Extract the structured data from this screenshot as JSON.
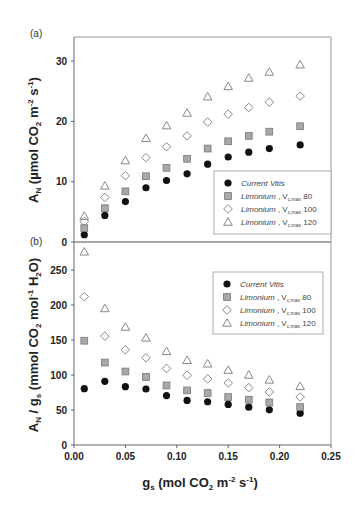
{
  "chart_data": [
    {
      "type": "scatter",
      "panel_label": "(a)",
      "title": "",
      "xlabel": "",
      "ylabel": "A_N (µmol CO2 m-2 s-1)",
      "ylabel_parts": {
        "main": "A",
        "sub": "N",
        "rest1": " (µmol CO",
        "sub2": "2",
        "rest2": " m",
        "sup1": "-2",
        "rest3": " s",
        "sup2": "-1",
        "rest4": ")"
      },
      "xlim": [
        0,
        0.25
      ],
      "ylim": [
        0,
        34
      ],
      "yticks": [
        0,
        10,
        20,
        30
      ],
      "ytick_labels": [
        "0",
        "10",
        "20",
        "30"
      ],
      "grid": false,
      "legend_position": "bottom-right",
      "x": [
        0.01,
        0.03,
        0.05,
        0.07,
        0.09,
        0.11,
        0.13,
        0.15,
        0.17,
        0.19,
        0.22
      ],
      "series": [
        {
          "name": "Current Vitis",
          "marker": "filled-circle",
          "values": [
            1.2,
            4.4,
            6.7,
            9.0,
            10.2,
            11.3,
            12.9,
            14.1,
            14.9,
            15.5,
            16.1
          ]
        },
        {
          "name": "Limonium , Vc,max 80",
          "marker": "gray-square",
          "values": [
            2.3,
            5.6,
            8.4,
            10.9,
            12.3,
            13.8,
            15.5,
            16.7,
            17.6,
            18.3,
            19.2
          ]
        },
        {
          "name": "Limonium , Vc,max 100",
          "marker": "open-diamond",
          "values": [
            3.4,
            7.4,
            11.0,
            14.0,
            15.8,
            17.6,
            19.9,
            21.2,
            22.3,
            23.2,
            24.2
          ]
        },
        {
          "name": "Limonium , Vc,max 120",
          "marker": "open-triangle",
          "values": [
            4.3,
            9.3,
            13.5,
            17.2,
            19.3,
            21.4,
            24.1,
            25.8,
            27.2,
            28.2,
            29.4
          ]
        }
      ]
    },
    {
      "type": "scatter",
      "panel_label": "(b)",
      "title": "",
      "xlabel": "g_s (mol CO2 m-2 s-1)",
      "ylabel": "A_N / g_s (mmol CO2 mol-1 H2O)",
      "xlim": [
        0,
        0.25
      ],
      "ylim": [
        0,
        290
      ],
      "xticks": [
        0,
        0.05,
        0.1,
        0.15,
        0.2,
        0.25
      ],
      "xtick_labels": [
        "0.00",
        "0.05",
        "0.10",
        "0.15",
        "0.20",
        "0.25"
      ],
      "yticks": [
        0,
        50,
        100,
        150,
        200,
        250
      ],
      "ytick_labels": [
        "0",
        "50",
        "100",
        "150",
        "200",
        "250"
      ],
      "grid": false,
      "legend_position": "top-right",
      "x": [
        0.01,
        0.03,
        0.05,
        0.07,
        0.09,
        0.11,
        0.13,
        0.15,
        0.17,
        0.19,
        0.22
      ],
      "series": [
        {
          "name": "Current Vitis",
          "marker": "filled-circle",
          "values": [
            80.5,
            91,
            83.3,
            80,
            70.6,
            63.7,
            61.8,
            58,
            54.1,
            50.3,
            45.5
          ]
        },
        {
          "name": "Limonium , Vc,max 80",
          "marker": "gray-square",
          "values": [
            149,
            117.8,
            105,
            97.2,
            85.1,
            78,
            74.2,
            68.5,
            64.7,
            60.8,
            54.2
          ]
        },
        {
          "name": "Limonium , Vc,max 100",
          "marker": "open-diamond",
          "values": [
            212,
            155.6,
            136,
            124.6,
            109.3,
            99.6,
            94.4,
            88.6,
            81.9,
            75.7,
            68.5
          ]
        },
        {
          "name": "Limonium , Vc,max 120",
          "marker": "open-triangle",
          "values": [
            276,
            195,
            168.5,
            153,
            133.8,
            121,
            116,
            107,
            100,
            93,
            83.8
          ]
        }
      ]
    }
  ],
  "axes": {
    "top_ylabel": {
      "a": "A",
      "a_sub": "N",
      "t1": " (µmol CO",
      "t1_sub": "2",
      "t2": " m",
      "t2_sup": "-2",
      "t3": " s",
      "t3_sup": "-1",
      "t4": ")"
    },
    "bottom_ylabel": {
      "a": "A",
      "a_sub": "N",
      "t1": " / g",
      "t1_sub": "s",
      "t2": " (mmol CO",
      "t2_sub": "2",
      "t3": " mol",
      "t3_sup": "-1",
      "t4": " H",
      "t4_sub": "2",
      "t5": "O)"
    },
    "xlabel": {
      "g": "g",
      "g_sub": "s",
      "t1": " (mol CO",
      "t1_sub": "2",
      "t2": " m",
      "t2_sup": "-2",
      "t3": " s",
      "t3_sup": "-1",
      "t4": ")"
    }
  },
  "legend": {
    "entries": [
      {
        "italic": "Current Vitis",
        "plain": "",
        "sub": "",
        "value": ""
      },
      {
        "italic": "Limonium",
        "plain": " , V",
        "sub": "c,max",
        "value": " 80"
      },
      {
        "italic": "Limonium",
        "plain": " , V",
        "sub": "c,max",
        "value": " 100"
      },
      {
        "italic": "Limonium",
        "plain": " , V",
        "sub": "c,max",
        "value": " 120"
      }
    ]
  },
  "colors": {
    "circle_fill": "#111111",
    "square_fill": "#a8a8a8",
    "square_stroke": "#777777",
    "open_stroke": "#888888"
  }
}
